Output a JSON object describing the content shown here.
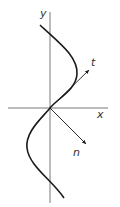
{
  "diagram": {
    "axes": {
      "x_label": "x",
      "y_label": "y"
    },
    "vectors": {
      "tangent_label": "t",
      "normal_label": "n"
    },
    "colors": {
      "curve": "#1a1a1a",
      "axis": "#555555",
      "background": "#ffffff"
    }
  }
}
